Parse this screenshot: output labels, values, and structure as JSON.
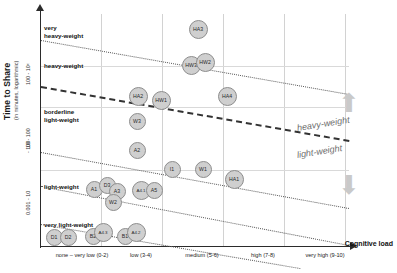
{
  "chart_data": {
    "type": "scatter",
    "title": "",
    "xlabel": "Cognitive load",
    "ylabel": "Time to Share",
    "ylabel_sub": "(in minutes, logarithmic)",
    "y_ticks": [
      "100 - 10ˣ",
      "- 100",
      "10 - 100",
      "0.001 - 10"
    ],
    "x_categories": [
      "none – very low (0-2)",
      "low (3-4)",
      "medium (5-6)",
      "high (7-8)",
      "very high (9-10)"
    ],
    "grid": true,
    "legend_position": "right",
    "zones": [
      {
        "label": "very\nheavy-weight"
      },
      {
        "label": "heavy-weight"
      },
      {
        "label": "borderline\nlight-weight"
      },
      {
        "label": "light-weight"
      },
      {
        "label": "very light-weight"
      }
    ],
    "zone_labels": [
      "very",
      "heavy-weight",
      "heavy-weight",
      "borderline",
      "light-weight",
      "light-weight",
      "very light-weight"
    ],
    "annotations": [
      {
        "text": "heavy-weight",
        "direction": "up"
      },
      {
        "text": "light-weight",
        "direction": "down"
      }
    ],
    "points": [
      {
        "label": "HA3",
        "x": 198,
        "y": 29
      },
      {
        "label": "HW3",
        "x": 191,
        "y": 65
      },
      {
        "label": "HW2",
        "x": 205,
        "y": 62
      },
      {
        "label": "HA2",
        "x": 138,
        "y": 96
      },
      {
        "label": "HW1",
        "x": 161,
        "y": 100
      },
      {
        "label": "HA4",
        "x": 227,
        "y": 96
      },
      {
        "label": "W3",
        "x": 137,
        "y": 121
      },
      {
        "label": "A2",
        "x": 137,
        "y": 150
      },
      {
        "label": "I1",
        "x": 172,
        "y": 169
      },
      {
        "label": "W1",
        "x": 203,
        "y": 169
      },
      {
        "label": "HA1",
        "x": 234,
        "y": 179
      },
      {
        "label": "A1",
        "x": 94,
        "y": 189
      },
      {
        "label": "D3",
        "x": 107,
        "y": 185
      },
      {
        "label": "A3",
        "x": 117,
        "y": 191
      },
      {
        "label": "W2",
        "x": 113,
        "y": 202
      },
      {
        "label": "A4.1",
        "x": 141,
        "y": 190
      },
      {
        "label": "A5",
        "x": 154,
        "y": 190
      },
      {
        "label": "D1",
        "x": 54,
        "y": 237
      },
      {
        "label": "D2",
        "x": 68,
        "y": 237
      },
      {
        "label": "B2",
        "x": 93,
        "y": 236
      },
      {
        "label": "A4.3",
        "x": 103,
        "y": 232
      },
      {
        "label": "B1",
        "x": 125,
        "y": 236
      },
      {
        "label": "A4.2",
        "x": 136,
        "y": 232
      }
    ],
    "dividers": [
      {
        "name": "very-heavy-boundary",
        "x1": 41,
        "y1": 40,
        "x2": 349,
        "y2": 94,
        "style": "dotted"
      },
      {
        "name": "heavy-light-boundary",
        "x1": 41,
        "y1": 86,
        "x2": 349,
        "y2": 140,
        "style": "bold-dash"
      },
      {
        "name": "borderline-boundary",
        "x1": 41,
        "y1": 152,
        "x2": 349,
        "y2": 208,
        "style": "dotted"
      },
      {
        "name": "light-boundary",
        "x1": 41,
        "y1": 186,
        "x2": 349,
        "y2": 245,
        "style": "dotted"
      },
      {
        "name": "very-light-boundary",
        "x1": 41,
        "y1": 224,
        "x2": 300,
        "y2": 268,
        "style": "dotted"
      }
    ]
  }
}
